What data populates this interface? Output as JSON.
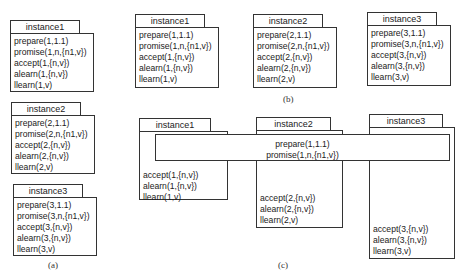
{
  "panels": {
    "a": {
      "caption": "(a)",
      "instances": [
        {
          "title": "instance1",
          "lines": [
            "prepare(1,1.1)",
            "promise(1,n,{n1,v})",
            "accept(1,{n,v})",
            "alearn(1,{n,v})",
            "llearn(1,v)"
          ]
        },
        {
          "title": "instance2",
          "lines": [
            "prepare(2,1.1)",
            "promise(2,n,{n1,v})",
            "accept(2,{n,v})",
            "alearn(2,{n,v})",
            "llearn(2,v)"
          ]
        },
        {
          "title": "instance3",
          "lines": [
            "prepare(3,1.1)",
            "promise(3,n,{n1,v})",
            "accept(3,{n,v})",
            "alearn(3,{n,v})",
            "llearn(3,v)"
          ]
        }
      ]
    },
    "b": {
      "caption": "(b)",
      "instances": [
        {
          "title": "instance1",
          "lines": [
            "prepare(1,1.1)",
            "promise(1,n,{n1,v})",
            "accept(1,{n,v})",
            "alearn(1,{n,v})",
            "llearn(1,v)"
          ]
        },
        {
          "title": "instance2",
          "lines": [
            "prepare(2,1.1)",
            "promise(2,n,{n1,v})",
            "accept(2,{n,v})",
            "alearn(2,{n,v})",
            "llearn(2,v)"
          ]
        },
        {
          "title": "instance3",
          "lines": [
            "prepare(3,1.1)",
            "promise(3,n,{n1,v})",
            "accept(3,{n,v})",
            "alearn(3,{n,v})",
            "llearn(3,v)"
          ]
        }
      ]
    },
    "c": {
      "caption": "(c)",
      "shared": [
        "prepare(1,1.1)",
        "promise(1,n,{n1,v})"
      ],
      "instances": [
        {
          "title": "instance1",
          "lines": [
            "accept(1,{n,v})",
            "alearn(1,{n,v})",
            "llearn(1,v)"
          ]
        },
        {
          "title": "instance2",
          "lines": [
            "accept(2,{n,v})",
            "alearn(2,{n,v})",
            "llearn(2,v)"
          ]
        },
        {
          "title": "instance3",
          "lines": [
            "accept(3,{n,v})",
            "alearn(3,{n,v})",
            "llearn(3,v)"
          ]
        }
      ]
    }
  }
}
